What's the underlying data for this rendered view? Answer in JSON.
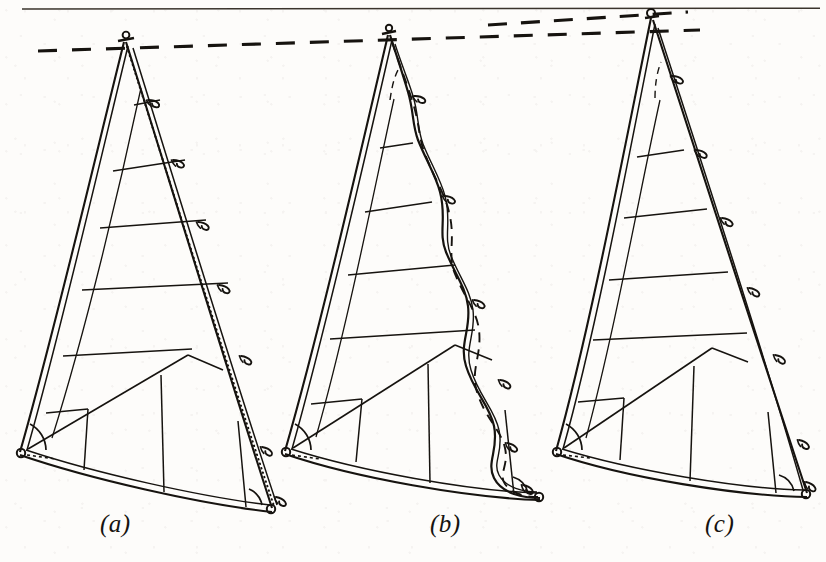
{
  "figure": {
    "background_color": "#fdfcfa",
    "ink_color": "#16130f",
    "width": 826,
    "height": 562,
    "top_rule": {
      "y": 9,
      "x1": 22,
      "x2": 820,
      "style": "solid"
    },
    "reference_lines": [
      {
        "name": "masthead-datum-long",
        "style": "dashed",
        "x1": 38,
        "y1": 51,
        "x2": 700,
        "y2": 30
      },
      {
        "name": "masthead-datum-upper",
        "style": "dashed",
        "x1": 488,
        "y1": 25,
        "x2": 688,
        "y2": 12
      }
    ]
  },
  "panels": [
    {
      "id": "a",
      "caption": "(a)",
      "caption_x": 100,
      "caption_y": 518,
      "leech_type": "straight-taut",
      "leech_line_shown": true,
      "leech_line_style": "dotted",
      "head": {
        "x": 124,
        "y": 42
      },
      "tack": {
        "x": 20,
        "y": 453
      },
      "clew": {
        "x": 272,
        "y": 512
      },
      "batten_count": 6,
      "seam_count": 5,
      "has_tack_angle_arc": true,
      "has_clew_angle_arc": true
    },
    {
      "id": "b",
      "caption": "(b)",
      "caption_x": 430,
      "caption_y": 518,
      "leech_type": "wavy-slack",
      "leech_line_shown": true,
      "leech_line_style": "dashed",
      "head": {
        "x": 388,
        "y": 35
      },
      "tack": {
        "x": 285,
        "y": 452
      },
      "clew": {
        "x": 540,
        "y": 500
      },
      "batten_count": 6,
      "seam_count": 5,
      "has_tack_angle_arc": true,
      "has_clew_angle_arc": true
    },
    {
      "id": "c",
      "caption": "(c)",
      "caption_x": 705,
      "caption_y": 518,
      "leech_type": "straight-clean",
      "leech_line_shown": false,
      "leech_line_style": "none",
      "head": {
        "x": 651,
        "y": 15
      },
      "tack": {
        "x": 556,
        "y": 452
      },
      "clew": {
        "x": 807,
        "y": 497
      },
      "batten_count": 5,
      "seam_count": 5,
      "has_tack_angle_arc": true,
      "has_clew_angle_arc": true
    }
  ]
}
